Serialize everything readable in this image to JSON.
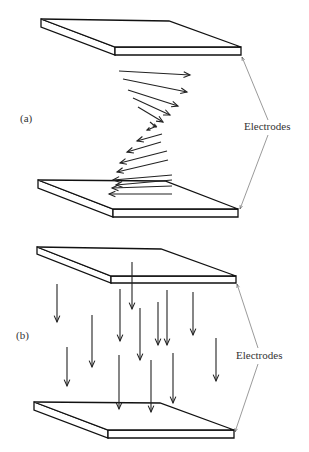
{
  "panels": [
    {
      "id": "a",
      "label": "(a)",
      "label_pos": [
        20,
        122
      ],
      "electrodes_label": "Electrodes",
      "electrodes_label_pos": [
        244,
        130
      ],
      "leaders": [
        [
          268,
          120,
          242,
          57
        ],
        [
          268,
          135,
          240,
          209
        ]
      ],
      "plates": [
        {
          "bl": [
            41,
            19
          ],
          "br": [
            169,
            21
          ],
          "fr": [
            241,
            47
          ],
          "fl": [
            115,
            47
          ],
          "t": 8
        },
        {
          "bl": [
            38,
            180
          ],
          "br": [
            165,
            181
          ],
          "fr": [
            238,
            209
          ],
          "fl": [
            113,
            209
          ],
          "t": 8
        }
      ],
      "arrows": [
        [
          119,
          71,
          190,
          75
        ],
        [
          123,
          79,
          187,
          92
        ],
        [
          128,
          90,
          178,
          106
        ],
        [
          133,
          98,
          170,
          115
        ],
        [
          138,
          107,
          163,
          122
        ],
        [
          150,
          122,
          156,
          127
        ],
        [
          157,
          126,
          147,
          130
        ],
        [
          162,
          134,
          137,
          141
        ],
        [
          161,
          142,
          127,
          152
        ],
        [
          167,
          151,
          120,
          163
        ],
        [
          168,
          160,
          117,
          172
        ],
        [
          172,
          175,
          113,
          180
        ],
        [
          172,
          180,
          116,
          185
        ],
        [
          172,
          186,
          112,
          188
        ],
        [
          172,
          194,
          109,
          194
        ]
      ]
    },
    {
      "id": "b",
      "label": "(b)",
      "label_pos": [
        16,
        339
      ],
      "electrodes_label": "Electrodes",
      "electrodes_label_pos": [
        236,
        359
      ],
      "leaders": [
        [
          258,
          348,
          237,
          284
        ],
        [
          258,
          364,
          235,
          432
        ]
      ],
      "plates": [
        {
          "bl": [
            37,
            247
          ],
          "br": [
            161,
            249
          ],
          "fr": [
            236,
            276
          ],
          "fl": [
            111,
            276
          ],
          "t": 7
        },
        {
          "bl": [
            34,
            402
          ],
          "br": [
            160,
            403
          ],
          "fr": [
            234,
            430
          ],
          "fl": [
            108,
            430
          ],
          "t": 8
        }
      ],
      "arrows": [
        [
          57,
          284,
          57,
          322
        ],
        [
          92,
          315,
          92,
          367
        ],
        [
          67,
          347,
          67,
          386
        ],
        [
          120,
          289,
          120,
          341
        ],
        [
          132,
          262,
          132,
          309
        ],
        [
          140,
          308,
          140,
          360
        ],
        [
          158,
          302,
          158,
          345
        ],
        [
          167,
          290,
          167,
          345
        ],
        [
          193,
          292,
          193,
          335
        ],
        [
          216,
          338,
          216,
          381
        ],
        [
          119,
          355,
          119,
          409
        ],
        [
          151,
          360,
          151,
          412
        ],
        [
          173,
          353,
          173,
          403
        ]
      ]
    }
  ]
}
